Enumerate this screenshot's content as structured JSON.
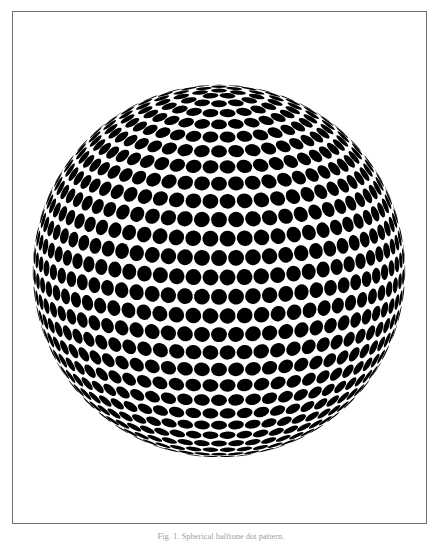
{
  "page": {
    "background_color": "#ffffff",
    "width": 442,
    "height": 544
  },
  "figure": {
    "frame": {
      "border_color": "#6d6f74",
      "background_color": "#ffffff"
    },
    "caption": "Fig. 1. Spherical halftone dot pattern.",
    "caption_color": "#9ea0a5",
    "alt": "halftone-sphere"
  },
  "sphere": {
    "center_x": 218,
    "center_y": 270,
    "radius": 186,
    "dot_color": "#000000",
    "background_color": "#ffffff",
    "latitude_bands": 30,
    "longitude_steps": 68,
    "dot_angular_size_deg": 2.45,
    "tilt_deg": 14
  }
}
